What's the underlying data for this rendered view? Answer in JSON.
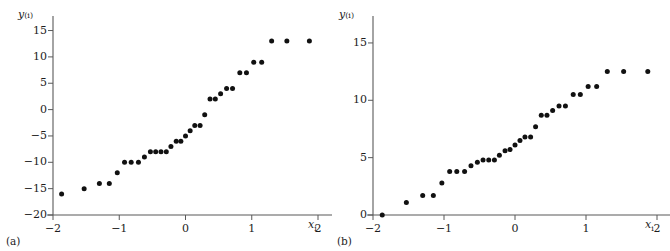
{
  "figure": {
    "background": "#ffffff",
    "marker_color": "#111111",
    "axis_color": "#595959"
  },
  "panels": [
    {
      "id": "a",
      "caption": "(a)",
      "xlabel": "x",
      "xlabel_sub": "i",
      "ylabel": "y",
      "ylabel_sub": "(i)"
    },
    {
      "id": "b",
      "caption": "(b)",
      "xlabel": "x",
      "xlabel_sub": "i",
      "ylabel": "y",
      "ylabel_sub": "(i)"
    }
  ],
  "chart_data": [
    {
      "type": "scatter",
      "panel": "a",
      "title": "",
      "xlabel": "x_i",
      "ylabel": "y_(i)",
      "xlim": [
        -2.0,
        2.0
      ],
      "ylim": [
        -20,
        17
      ],
      "xticks": [
        -2,
        -1,
        0,
        1,
        2
      ],
      "xticklabels": [
        "−2",
        "−1",
        "0",
        "1",
        "2"
      ],
      "yticks": [
        -20,
        -15,
        -10,
        -5,
        0,
        5,
        10,
        15
      ],
      "yticklabels": [
        "−20",
        "−15",
        "−10",
        "−5",
        "0",
        "5",
        "10",
        "15"
      ],
      "grid": false,
      "legend": false,
      "n_points": 34,
      "x": [
        -1.87,
        -1.53,
        -1.3,
        -1.15,
        -1.03,
        -0.92,
        -0.82,
        -0.71,
        -0.62,
        -0.53,
        -0.45,
        -0.37,
        -0.29,
        -0.22,
        -0.14,
        -0.07,
        0.0,
        0.07,
        0.14,
        0.22,
        0.29,
        0.37,
        0.45,
        0.53,
        0.62,
        0.71,
        0.82,
        0.92,
        1.03,
        1.15,
        1.3,
        1.53,
        1.87,
        0.0
      ],
      "y": [
        -16,
        -15,
        -14,
        -14,
        -12,
        -10,
        -10,
        -10,
        -9,
        -8,
        -8,
        -8,
        -8,
        -7,
        -6,
        -6,
        -5,
        -4,
        -3,
        -3,
        -1,
        2,
        2,
        3,
        4,
        4,
        7,
        7,
        9,
        9,
        13,
        13,
        13,
        null
      ]
    },
    {
      "type": "scatter",
      "panel": "b",
      "title": "",
      "xlabel": "x_i",
      "ylabel": "y_(i)",
      "xlim": [
        -2.0,
        2.0
      ],
      "ylim": [
        0,
        17
      ],
      "xticks": [
        -2,
        -1,
        0,
        1,
        2
      ],
      "xticklabels": [
        "−2",
        "−1",
        "0",
        "1",
        "2"
      ],
      "yticks": [
        0,
        5,
        10,
        15
      ],
      "yticklabels": [
        "0",
        "5",
        "10",
        "15"
      ],
      "grid": false,
      "legend": false,
      "n_points": 34,
      "x": [
        -1.87,
        -1.53,
        -1.3,
        -1.15,
        -1.03,
        -0.92,
        -0.82,
        -0.71,
        -0.62,
        -0.53,
        -0.45,
        -0.37,
        -0.29,
        -0.22,
        -0.14,
        -0.07,
        0.0,
        0.07,
        0.14,
        0.22,
        0.29,
        0.37,
        0.45,
        0.53,
        0.62,
        0.71,
        0.82,
        0.92,
        1.03,
        1.15,
        1.3,
        1.53,
        1.87
      ],
      "y": [
        0.0,
        1.1,
        1.7,
        1.7,
        2.8,
        3.8,
        3.8,
        3.8,
        4.3,
        4.6,
        4.8,
        4.8,
        4.8,
        5.2,
        5.6,
        5.7,
        6.1,
        6.5,
        6.8,
        6.8,
        7.7,
        8.7,
        8.7,
        9.1,
        9.5,
        9.5,
        10.5,
        10.5,
        11.2,
        11.2,
        12.5,
        12.5,
        12.5
      ]
    }
  ]
}
